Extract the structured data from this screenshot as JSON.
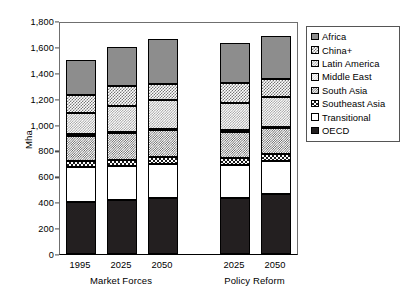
{
  "chart_data": {
    "type": "bar",
    "subtype": "stacked-bar",
    "title": "",
    "xlabel": "",
    "ylabel": "Mha",
    "ylim": [
      0,
      1800
    ],
    "ytick_step": 200,
    "yticks": [
      "1,800",
      "1,600",
      "1,400",
      "1,200",
      "1,000",
      "800",
      "600",
      "400",
      "200",
      "0"
    ],
    "ytick_values": [
      1800,
      1600,
      1400,
      1200,
      1000,
      800,
      600,
      400,
      200,
      0
    ],
    "grid": false,
    "legend_position": "right",
    "categories": [
      "1995",
      "2025",
      "2050",
      "2025",
      "2050"
    ],
    "groups": [
      {
        "label": "Market Forces",
        "categories": [
          "1995",
          "2025",
          "2050"
        ]
      },
      {
        "label": "Policy Reform",
        "categories": [
          "2025",
          "2050"
        ]
      }
    ],
    "series": [
      {
        "name": "OECD",
        "pattern": "solid-black",
        "values": [
          405,
          415,
          435,
          435,
          465
        ]
      },
      {
        "name": "Transitional",
        "pattern": "solid-white",
        "values": [
          265,
          265,
          260,
          255,
          250
        ]
      },
      {
        "name": "Southeast Asia",
        "pattern": "checkerboard-black",
        "values": [
          45,
          50,
          55,
          50,
          55
        ]
      },
      {
        "name": "South Asia",
        "pattern": "checkerboard-dark",
        "values": [
          200,
          205,
          205,
          205,
          205
        ]
      },
      {
        "name": "Middle East",
        "pattern": "checkerboard-light",
        "values": [
          10,
          10,
          10,
          10,
          10
        ]
      },
      {
        "name": "Latin America",
        "pattern": "checkerboard-mid",
        "values": [
          165,
          200,
          225,
          210,
          225
        ]
      },
      {
        "name": "China+",
        "pattern": "checkerboard-gray",
        "values": [
          140,
          155,
          125,
          160,
          145
        ]
      },
      {
        "name": "Africa",
        "pattern": "solid-gray",
        "values": [
          270,
          300,
          345,
          305,
          330
        ]
      }
    ],
    "totals": [
      1500,
      1600,
      1660,
      1630,
      1685
    ],
    "legend_entries": [
      "Africa",
      "China+",
      "Latin America",
      "Middle East",
      "South Asia",
      "Southeast Asia",
      "Transitional",
      "OECD"
    ],
    "colors": {
      "africa": "#8d8d8d",
      "china_plus": "#767676",
      "latin_america": "#9a9a9a",
      "middle_east": "#c9c9c9",
      "south_asia": "#5d5d5d",
      "southeast_asia": "#1a1a1a",
      "transitional": "#ffffff",
      "oecd": "#231f20",
      "axis": "#000000",
      "frame": "#6f6f6f"
    }
  }
}
